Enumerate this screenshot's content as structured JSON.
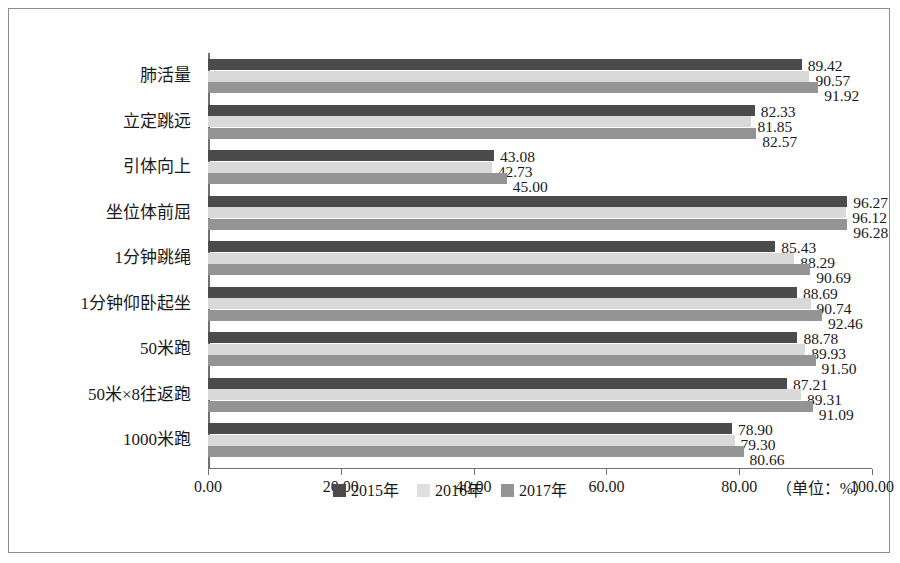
{
  "chart_data": {
    "type": "bar",
    "orientation": "horizontal",
    "title": "",
    "xlabel": "",
    "ylabel": "",
    "xlim": [
      0,
      100
    ],
    "xticks": [
      "0.00",
      "20.00",
      "40.00",
      "60.00",
      "80.00",
      "100.00"
    ],
    "xtick_values": [
      0,
      20,
      40,
      60,
      80,
      100
    ],
    "grid": false,
    "legend_position": "bottom-center",
    "unit_note": "（单位：%）",
    "categories": [
      "肺活量",
      "立定跳远",
      "引体向上",
      "坐位体前屈",
      "1分钟跳绳",
      "1分钟仰卧起坐",
      "50米跑",
      "50米×8往返跑",
      "1000米跑"
    ],
    "series": [
      {
        "name": "2015年",
        "color": "#4b4b4b",
        "values": [
          89.42,
          82.33,
          43.08,
          96.27,
          85.43,
          88.69,
          88.78,
          87.21,
          78.9
        ],
        "labels": [
          "89.42",
          "82.33",
          "43.08",
          "96.27",
          "85.43",
          "88.69",
          "88.78",
          "87.21",
          "78.90"
        ]
      },
      {
        "name": "2016年",
        "color": "#d9d9d9",
        "values": [
          90.57,
          81.85,
          42.73,
          96.12,
          88.29,
          90.74,
          89.93,
          89.31,
          79.3
        ],
        "labels": [
          "90.57",
          "81.85",
          "42.73",
          "96.12",
          "88.29",
          "90.74",
          "89.93",
          "89.31",
          "79.30"
        ]
      },
      {
        "name": "2017年",
        "color": "#949494",
        "values": [
          91.92,
          82.57,
          45.0,
          96.28,
          90.69,
          92.46,
          91.5,
          91.09,
          80.66
        ],
        "labels": [
          "91.92",
          "82.57",
          "45.00",
          "96.28",
          "90.69",
          "92.46",
          "91.50",
          "91.09",
          "80.66"
        ]
      }
    ]
  }
}
